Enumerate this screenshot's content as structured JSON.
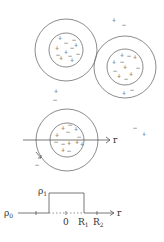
{
  "colors": {
    "stroke": "#6e6e6e",
    "text": "#333333",
    "background": "#ffffff"
  },
  "particles": [
    {
      "name": "particle-top-left",
      "cx": 66,
      "cy": 50,
      "outer_r": 31,
      "inner_r": 17,
      "charges": [
        [
          "+",
          60,
          38
        ],
        [
          "−",
          66,
          43
        ],
        [
          "+",
          57,
          48
        ],
        [
          "+",
          66,
          52
        ],
        [
          "−",
          72,
          48
        ],
        [
          "+",
          76,
          45
        ],
        [
          "−",
          58,
          55
        ],
        [
          "+",
          61,
          58
        ],
        [
          "−",
          70,
          56
        ],
        [
          "+",
          72,
          60
        ],
        [
          "−",
          78,
          54
        ],
        [
          "−",
          74,
          40
        ]
      ]
    },
    {
      "name": "particle-top-right",
      "cx": 125,
      "cy": 67,
      "outer_r": 31,
      "inner_r": 18,
      "charges": [
        [
          "+",
          122,
          55
        ],
        [
          "−",
          129,
          56
        ],
        [
          "+",
          135,
          57
        ],
        [
          "+",
          114,
          62
        ],
        [
          "−",
          122,
          62
        ],
        [
          "+",
          125,
          67
        ],
        [
          "−",
          115,
          71
        ],
        [
          "−",
          138,
          68
        ],
        [
          "+",
          119,
          76
        ],
        [
          "+",
          131,
          74
        ],
        [
          "−",
          126,
          79
        ],
        [
          "+",
          124,
          93
        ],
        [
          "−",
          132,
          90
        ]
      ]
    },
    {
      "name": "particle-center",
      "cx": 67,
      "cy": 140,
      "outer_r": 31,
      "inner_r": 17,
      "charges": [
        [
          "+",
          63,
          128
        ],
        [
          "−",
          70,
          125
        ],
        [
          "+",
          76,
          129
        ],
        [
          "−",
          68,
          132
        ],
        [
          "+",
          57,
          135
        ],
        [
          "−",
          79,
          137
        ],
        [
          "−",
          56,
          142
        ],
        [
          "−",
          63,
          144
        ],
        [
          "+",
          69,
          143
        ],
        [
          "+",
          77,
          142
        ],
        [
          "+",
          82,
          144
        ],
        [
          "+",
          63,
          150
        ],
        [
          "−",
          69,
          151
        ]
      ]
    }
  ],
  "stray_charges": [
    [
      "+",
      114,
      20
    ],
    [
      "−",
      124,
      25
    ],
    [
      "+",
      56,
      91
    ],
    [
      "−",
      55,
      100
    ],
    [
      "−",
      135,
      128
    ],
    [
      "+",
      144,
      134
    ],
    [
      "−",
      37,
      165
    ]
  ],
  "r_axis": {
    "label": "r",
    "y": 140,
    "x1": 23,
    "x2": 110
  },
  "density_graph": {
    "rho0_label": "ρ",
    "rho0_sub": "0",
    "rho1_label": "ρ",
    "rho1_sub": "1",
    "zero_label": "0",
    "r1_label": "R",
    "r1_sub": "1",
    "r2_label": "R",
    "r2_sub": "2",
    "axis_label": "r"
  }
}
